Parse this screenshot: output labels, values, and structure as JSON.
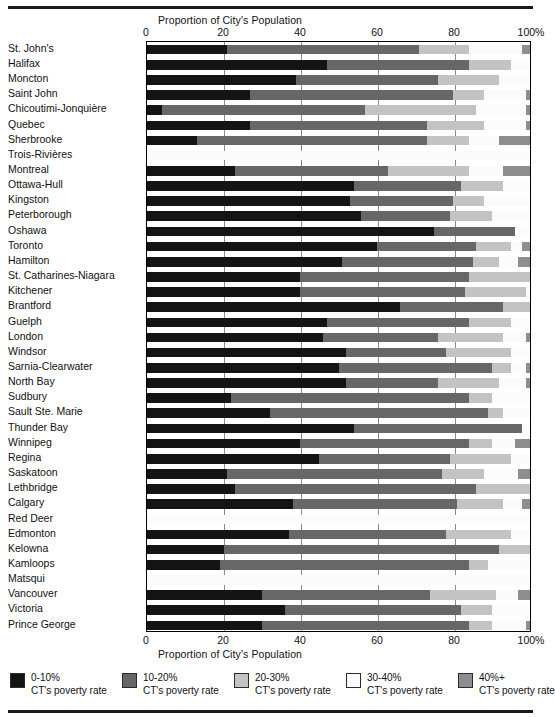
{
  "axis": {
    "title_top": "Proportion of City's Population",
    "title_bottom": "Proportion of City's Population",
    "ticks": [
      "0",
      "20",
      "40",
      "60",
      "80",
      "100%"
    ],
    "tick_values": [
      0,
      20,
      40,
      60,
      80,
      100
    ]
  },
  "legend": {
    "items": [
      {
        "label": "0-10%",
        "sub": "CT's poverty rate",
        "color": "#141414"
      },
      {
        "label": "10-20%",
        "sub": "CT's poverty rate",
        "color": "#676767"
      },
      {
        "label": "20-30%",
        "sub": "CT's poverty rate",
        "color": "#c3c3c3"
      },
      {
        "label": "30-40%",
        "sub": "CT's poverty rate",
        "color": "#fbfbfb"
      },
      {
        "label": "40%+",
        "sub": "CT's poverty rate",
        "color": "#8e8e8e"
      }
    ]
  },
  "chart_data": {
    "type": "bar",
    "orientation": "horizontal",
    "stacked": true,
    "stacked_normalized": true,
    "title": "",
    "xlabel": "Proportion of City's Population",
    "ylabel": "",
    "xlim": [
      0,
      100
    ],
    "xticks": [
      0,
      20,
      40,
      60,
      80,
      100
    ],
    "grid": true,
    "legend_position": "bottom",
    "series": [
      {
        "name": "0-10% CT's poverty rate",
        "color": "#141414",
        "values": [
          21,
          47,
          39,
          27,
          4,
          27,
          13,
          0,
          23,
          54,
          53,
          56,
          75,
          60,
          51,
          40,
          40,
          66,
          47,
          46,
          52,
          50,
          52,
          22,
          32,
          54,
          40,
          45,
          21,
          23,
          38,
          0,
          37,
          20,
          19,
          0,
          30,
          36,
          30
        ]
      },
      {
        "name": "10-20% CT's poverty rate",
        "color": "#676767",
        "values": [
          50,
          37,
          37,
          53,
          53,
          46,
          60,
          0,
          40,
          28,
          27,
          23,
          21,
          26,
          34,
          44,
          43,
          27,
          37,
          30,
          26,
          40,
          24,
          62,
          57,
          44,
          44,
          34,
          56,
          63,
          43,
          0,
          41,
          72,
          65,
          0,
          44,
          46,
          54
        ]
      },
      {
        "name": "20-30% CT's poverty rate",
        "color": "#c3c3c3",
        "values": [
          13,
          11,
          16,
          8,
          29,
          15,
          11,
          0,
          21,
          11,
          8,
          11,
          0,
          9,
          7,
          16,
          16,
          7,
          11,
          17,
          17,
          5,
          16,
          6,
          4,
          0,
          6,
          16,
          11,
          14,
          12,
          0,
          17,
          8,
          5,
          0,
          17,
          8,
          6
        ]
      },
      {
        "name": "30-40% CT's poverty rate",
        "color": "#fbfbfb",
        "values": [
          14,
          5,
          8,
          11,
          13,
          11,
          8,
          100,
          9,
          7,
          12,
          10,
          4,
          3,
          5,
          0,
          1,
          0,
          5,
          6,
          5,
          4,
          7,
          10,
          7,
          2,
          6,
          5,
          9,
          0,
          5,
          100,
          5,
          0,
          11,
          100,
          6,
          10,
          9
        ]
      },
      {
        "name": "40%+ CT's poverty rate",
        "color": "#8e8e8e",
        "values": [
          2,
          0,
          0,
          1,
          1,
          1,
          8,
          0,
          7,
          0,
          0,
          0,
          0,
          2,
          3,
          0,
          0,
          0,
          0,
          1,
          0,
          1,
          1,
          0,
          0,
          0,
          4,
          0,
          3,
          0,
          2,
          0,
          0,
          0,
          0,
          0,
          3,
          0,
          1
        ]
      }
    ],
    "categories": [
      "St. John's",
      "Halifax",
      "Moncton",
      "Saint John",
      "Chicoutimi-Jonquière",
      "Quebec",
      "Sherbrooke",
      "Trois-Rivières",
      "Montreal",
      "Ottawa-Hull",
      "Kingston",
      "Peterborough",
      "Oshawa",
      "Toronto",
      "Hamilton",
      "St. Catharines-Niagara",
      "Kitchener",
      "Brantford",
      "Guelph",
      "London",
      "Windsor",
      "Sarnia-Clearwater",
      "North Bay",
      "Sudbury",
      "Sault Ste. Marie",
      "Thunder Bay",
      "Winnipeg",
      "Regina",
      "Saskatoon",
      "Lethbridge",
      "Calgary",
      "Red Deer",
      "Edmonton",
      "Kelowna",
      "Kamloops",
      "Matsqui",
      "Vancouver",
      "Victoria",
      "Prince George"
    ]
  }
}
